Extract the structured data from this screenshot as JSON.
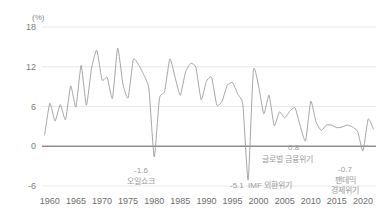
{
  "chart_data": {
    "type": "line",
    "title": "",
    "subtitle": "",
    "xlabel": "",
    "ylabel": "(%)",
    "unit_label": "(%)",
    "ylim": [
      -6,
      18
    ],
    "xlim": [
      1958.5,
      2022.5
    ],
    "grid": true,
    "legend_position": "none",
    "y_ticks": [
      18,
      12,
      6,
      0,
      -6
    ],
    "y_tick_labels": [
      "18",
      "12",
      "6",
      "0",
      "-6"
    ],
    "x_ticks": [
      1960,
      1965,
      1970,
      1975,
      1980,
      1985,
      1990,
      1995,
      2000,
      2005,
      2010,
      2015,
      2020
    ],
    "x_tick_labels": [
      "1960",
      "1965",
      "1970",
      "1975",
      "1980",
      "1985",
      "1990",
      "1995",
      "2000",
      "2005",
      "2010",
      "2015",
      "2020"
    ],
    "series": [
      {
        "name": "실질 GDP 성장률",
        "color": "#9b9b9b",
        "x": [
          1959,
          1960,
          1961,
          1962,
          1963,
          1964,
          1965,
          1966,
          1967,
          1968,
          1969,
          1970,
          1971,
          1972,
          1973,
          1974,
          1975,
          1976,
          1977,
          1978,
          1979,
          1980,
          1981,
          1982,
          1983,
          1984,
          1985,
          1986,
          1987,
          1988,
          1989,
          1990,
          1991,
          1992,
          1993,
          1994,
          1995,
          1996,
          1997,
          1998,
          1999,
          2000,
          2001,
          2002,
          2003,
          2004,
          2005,
          2006,
          2007,
          2008,
          2009,
          2010,
          2011,
          2012,
          2013,
          2014,
          2015,
          2016,
          2017,
          2018,
          2019,
          2020,
          2021,
          2022
        ],
        "values": [
          1.7,
          6.5,
          3.8,
          6.3,
          4.0,
          9.1,
          5.9,
          12.2,
          6.2,
          11.8,
          14.5,
          10.0,
          10.4,
          7.2,
          14.8,
          9.4,
          7.3,
          13.1,
          12.3,
          10.8,
          8.6,
          -1.6,
          7.2,
          8.3,
          13.2,
          10.4,
          7.7,
          11.2,
          12.5,
          11.9,
          7.0,
          9.8,
          10.4,
          6.2,
          6.8,
          9.2,
          9.6,
          7.9,
          6.2,
          -5.1,
          11.5,
          9.1,
          4.9,
          7.7,
          3.1,
          5.2,
          4.3,
          5.3,
          5.8,
          3.0,
          0.8,
          6.8,
          3.7,
          2.4,
          3.2,
          3.2,
          2.8,
          2.9,
          3.2,
          2.9,
          2.2,
          -0.7,
          4.1,
          2.6
        ]
      }
    ],
    "annotations": [
      {
        "id": "oil-shock",
        "value_label": "-1.6",
        "text_label": "오일쇼크",
        "x_year": 1980,
        "y_value": -1.6
      },
      {
        "id": "imf-crisis",
        "value_label": "-5.1",
        "text_label": "IMF 외환위기",
        "x_year": 1998,
        "y_value": -5.1
      },
      {
        "id": "global-financial-crisis",
        "value_label": "0.8",
        "text_label": "글로벌 금융위기",
        "x_year": 2009,
        "y_value": 0.8
      },
      {
        "id": "pandemic-crisis",
        "value_label": "-0.7",
        "text_label_line1": "팬데믹",
        "text_label_line2": "경제위기",
        "x_year": 2020,
        "y_value": -0.7
      }
    ],
    "colors": {
      "line": "#9b9b9b",
      "grid": "#e3e3e3",
      "zero_axis": "#8d8d8d",
      "tick_text": "#6e6e6e",
      "annotation_text": "#9a9a9a",
      "background": "#ffffff"
    }
  }
}
